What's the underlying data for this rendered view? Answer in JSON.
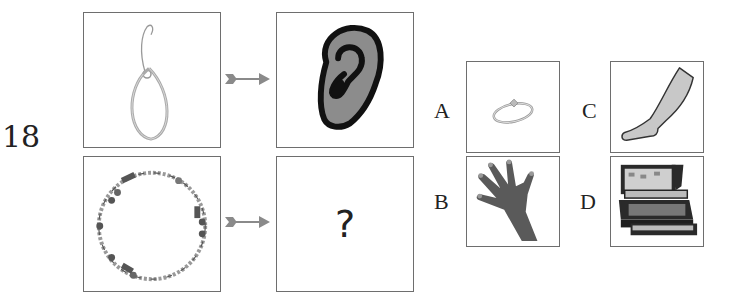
{
  "question": {
    "number": "18",
    "pairs": [
      {
        "source": "hoop-earring",
        "target": "ear"
      },
      {
        "source": "beaded-bracelet",
        "target_text": "?"
      }
    ]
  },
  "options": [
    {
      "label": "A",
      "item": "ring"
    },
    {
      "label": "B",
      "item": "hand-glove"
    },
    {
      "label": "C",
      "item": "leg"
    },
    {
      "label": "D",
      "item": "jewelry-box"
    }
  ],
  "colors": {
    "border": "#6e6e6e",
    "arrow": "#8a8a8a",
    "ear_fill": "#8c8c8c",
    "hand_fill": "#5a5a5a",
    "leg_fill": "#c8c8c8"
  }
}
